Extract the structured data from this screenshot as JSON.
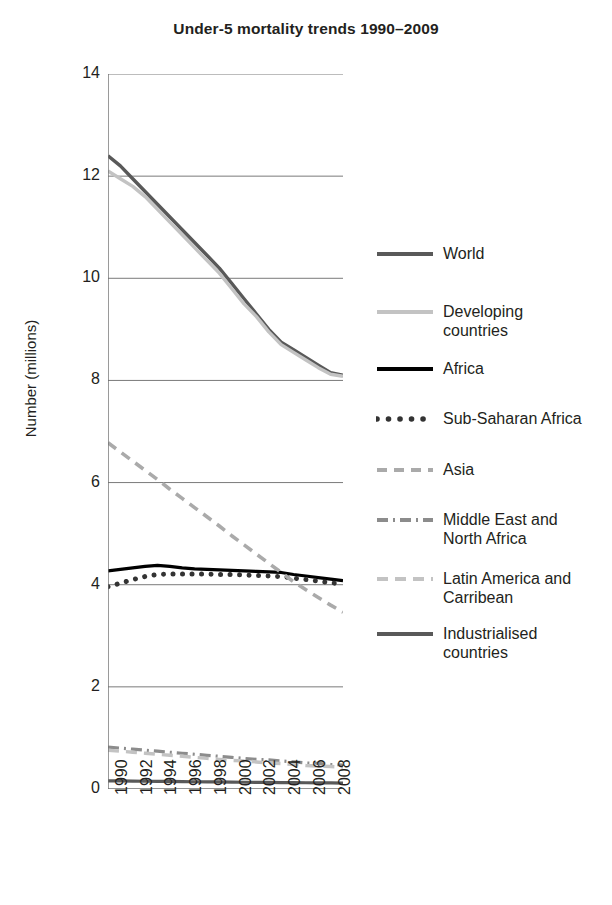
{
  "chart_data": {
    "type": "line",
    "title": "Under-5 mortality trends 1990–2009",
    "xlabel": "",
    "ylabel": "Number (millions)",
    "ylim": [
      0,
      14
    ],
    "yticks": [
      0,
      2,
      4,
      6,
      8,
      10,
      12,
      14
    ],
    "xlim": [
      1990,
      2009
    ],
    "xticks": [
      1990,
      1992,
      1994,
      1996,
      1998,
      2000,
      2002,
      2004,
      2006,
      2008
    ],
    "xticklabels": [
      "1990",
      "1992",
      "1994",
      "1996",
      "1998",
      "2000",
      "2002",
      "2004",
      "2006",
      "2008"
    ],
    "grid": "horizontal",
    "legend_position": "right",
    "x": [
      1990,
      1991,
      1992,
      1993,
      1994,
      1995,
      1996,
      1997,
      1998,
      1999,
      2000,
      2001,
      2002,
      2003,
      2004,
      2005,
      2006,
      2007,
      2008,
      2009
    ],
    "series": [
      {
        "name": "World",
        "style": "solid",
        "color": "#595959",
        "width": 3.4,
        "values": [
          12.4,
          12.2,
          11.95,
          11.7,
          11.45,
          11.2,
          10.95,
          10.7,
          10.45,
          10.2,
          9.9,
          9.6,
          9.3,
          9.0,
          8.75,
          8.6,
          8.45,
          8.3,
          8.15,
          8.1
        ]
      },
      {
        "name": "Developing countries",
        "style": "solid",
        "color": "#c3c3c3",
        "width": 3.4,
        "values": [
          12.1,
          11.95,
          11.8,
          11.6,
          11.35,
          11.1,
          10.85,
          10.6,
          10.35,
          10.1,
          9.8,
          9.5,
          9.25,
          8.95,
          8.7,
          8.55,
          8.4,
          8.25,
          8.12,
          8.08
        ]
      },
      {
        "name": "Africa",
        "style": "solid",
        "color": "#000000",
        "width": 3.2,
        "values": [
          4.27,
          4.3,
          4.33,
          4.36,
          4.38,
          4.36,
          4.33,
          4.31,
          4.3,
          4.29,
          4.28,
          4.27,
          4.26,
          4.25,
          4.24,
          4.2,
          4.17,
          4.14,
          4.11,
          4.08
        ]
      },
      {
        "name": "Sub-Saharan Africa",
        "style": "dotted",
        "color": "#333333",
        "width": 5,
        "values": [
          3.96,
          4.03,
          4.1,
          4.16,
          4.2,
          4.21,
          4.21,
          4.21,
          4.21,
          4.2,
          4.2,
          4.19,
          4.18,
          4.17,
          4.16,
          4.13,
          4.1,
          4.07,
          4.04,
          4.01
        ]
      },
      {
        "name": "Asia",
        "style": "dashed",
        "color": "#aaaaaa",
        "width": 3.6,
        "values": [
          6.78,
          6.6,
          6.42,
          6.24,
          6.06,
          5.87,
          5.69,
          5.51,
          5.33,
          5.15,
          4.96,
          4.78,
          4.6,
          4.42,
          4.24,
          4.06,
          3.9,
          3.75,
          3.6,
          3.46
        ]
      },
      {
        "name": "Middle East and North Africa",
        "style": "dashdot",
        "color": "#8c8c8c",
        "width": 3.2,
        "values": [
          0.82,
          0.8,
          0.78,
          0.76,
          0.74,
          0.72,
          0.7,
          0.68,
          0.66,
          0.64,
          0.62,
          0.6,
          0.58,
          0.57,
          0.55,
          0.53,
          0.51,
          0.5,
          0.48,
          0.47
        ]
      },
      {
        "name": "Latin America and Carribean",
        "style": "dashed-light",
        "color": "#c3c3c3",
        "width": 3.4,
        "values": [
          0.76,
          0.74,
          0.72,
          0.7,
          0.68,
          0.66,
          0.64,
          0.62,
          0.6,
          0.58,
          0.56,
          0.55,
          0.53,
          0.51,
          0.5,
          0.48,
          0.46,
          0.45,
          0.44,
          0.43
        ]
      },
      {
        "name": "Industrialised countries",
        "style": "solid",
        "color": "#595959",
        "width": 3.2,
        "values": [
          0.16,
          0.158,
          0.155,
          0.152,
          0.15,
          0.148,
          0.145,
          0.142,
          0.14,
          0.138,
          0.135,
          0.132,
          0.13,
          0.128,
          0.126,
          0.124,
          0.122,
          0.12,
          0.118,
          0.116
        ]
      }
    ]
  },
  "legend": {
    "items": [
      {
        "label": "World",
        "key": "world"
      },
      {
        "label": "Developing\ncountries",
        "key": "developing-countries"
      },
      {
        "label": "Africa",
        "key": "africa"
      },
      {
        "label": "Sub-Saharan Africa",
        "key": "sub-saharan-africa"
      },
      {
        "label": "Asia",
        "key": "asia"
      },
      {
        "label": "Middle East and\nNorth Africa",
        "key": "middle-east-and-north-africa"
      },
      {
        "label": "Latin America and\nCarribean",
        "key": "latin-america-and-carribean"
      },
      {
        "label": "Industrialised\ncountries",
        "key": "industrialised-countries"
      }
    ]
  },
  "colors": {
    "text": "#231f20",
    "axis": "#6f6f6f",
    "grid": "#7a7a7a",
    "world": "#595959",
    "developing": "#c3c3c3",
    "africa": "#000000",
    "sub_saharan": "#333333",
    "asia": "#aaaaaa",
    "mena": "#8c8c8c",
    "latin_america": "#c3c3c3",
    "industrialised": "#595959"
  }
}
